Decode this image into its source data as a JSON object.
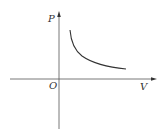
{
  "diagram": {
    "labels": {
      "y_axis": "P",
      "x_axis": "V",
      "origin": "O"
    },
    "colors": {
      "axis": "#555555",
      "curve": "#333333",
      "background": "#ffffff"
    },
    "curve": {
      "shape": "hyperbola",
      "relation": "P ∝ 1/V",
      "quadrant": "first"
    }
  }
}
